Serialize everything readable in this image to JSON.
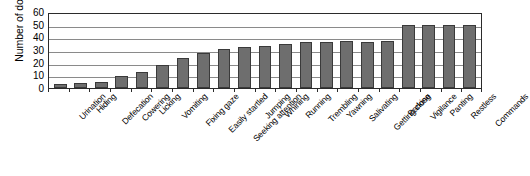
{
  "chart_data": {
    "type": "bar",
    "title": "",
    "xlabel": "",
    "ylabel": "Number of dogs",
    "ylim": [
      0,
      60
    ],
    "yticks": [
      60,
      50,
      40,
      30,
      20,
      10,
      0
    ],
    "grid": true,
    "legend": "none",
    "orientation": "vertical",
    "bar_color": "#6e6e6e",
    "bar_border_color": "#3a3a3a",
    "categories": [
      "Urination",
      "Hiding",
      "Defecation",
      "Cowering",
      "Licking",
      "Vomiting",
      "Fixing gaze",
      "Easily startled",
      "Seeking attention",
      "Jumping",
      "Whining",
      "Running",
      "Trembling",
      "Yawning",
      "Salivating",
      "Getting close",
      "Barking",
      "Vigilance",
      "Panting",
      "Restless",
      "Commands"
    ],
    "values": [
      3,
      4,
      5,
      9.5,
      12.5,
      18,
      24,
      27.5,
      30.5,
      32,
      33.5,
      34.5,
      36,
      36,
      37,
      36.5,
      37.5,
      50,
      50,
      50,
      50
    ],
    "series": [
      {
        "name": "Number of dogs",
        "values": [
          3,
          4,
          5,
          9.5,
          12.5,
          18,
          24,
          27.5,
          30.5,
          32,
          33.5,
          34.5,
          36,
          36,
          37,
          36.5,
          37.5,
          50,
          50,
          50,
          50
        ]
      }
    ]
  }
}
